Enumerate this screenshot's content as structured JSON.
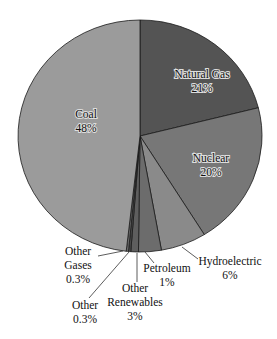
{
  "chart_data": {
    "type": "pie",
    "title": "",
    "start_angle_deg": 0,
    "direction": "clockwise",
    "slices": [
      {
        "label": "Natural Gas",
        "value": 21,
        "display": "21%",
        "color": "#545454"
      },
      {
        "label": "Nuclear",
        "value": 20,
        "display": "20%",
        "color": "#777777"
      },
      {
        "label": "Hydroelectric",
        "value": 6,
        "display": "6%",
        "color": "#8a8a8a"
      },
      {
        "label": "Other Renewables",
        "value": 3,
        "display": "3%",
        "color": "#6c6c6c"
      },
      {
        "label": "Petroleum",
        "value": 1,
        "display": "1%",
        "color": "#5e5e5e"
      },
      {
        "label": "Other",
        "value": 0.3,
        "display": "0.3%",
        "color": "#4a4a4a"
      },
      {
        "label": "Other Gases",
        "value": 0.3,
        "display": "0.3%",
        "color": "#6a6a6a"
      },
      {
        "label": "Coal",
        "value": 48,
        "display": "48%",
        "color": "#9b9b9b"
      }
    ],
    "labels": {
      "natural_gas": {
        "name": "Natural Gas",
        "pct": "21%"
      },
      "nuclear": {
        "name": "Nuclear",
        "pct": "20%"
      },
      "coal": {
        "name": "Coal",
        "pct": "48%"
      },
      "hydro": {
        "name": "Hydroelectric",
        "pct": "6%"
      },
      "petroleum": {
        "name": "Petroleum",
        "pct": "1%"
      },
      "other_renewables": {
        "line1": "Other",
        "line2": "Renewables",
        "pct": "3%"
      },
      "other_gases": {
        "line1": "Other",
        "line2": "Gases",
        "pct": "0.3%"
      },
      "other": {
        "name": "Other",
        "pct": "0.3%"
      }
    },
    "legend": "none (labels on/near slices)"
  }
}
